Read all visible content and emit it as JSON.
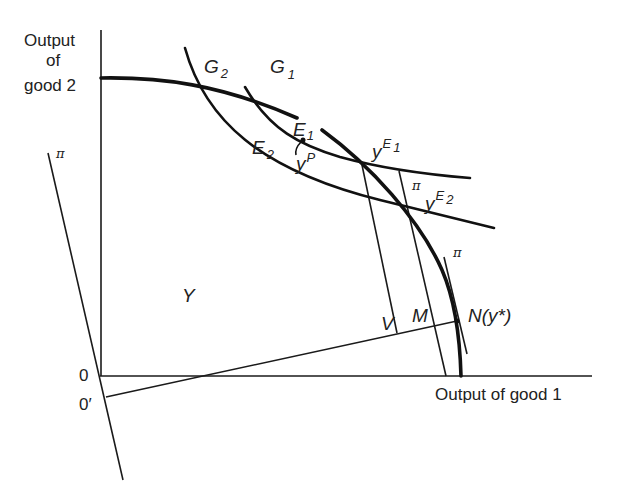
{
  "axes": {
    "y_label_line1": "Output",
    "y_label_line2": "of",
    "y_label_line3": "good 2",
    "x_label": "Output of good 1",
    "origin": "0",
    "origin_prime": "0′"
  },
  "labels": {
    "G2_main": "G",
    "G2_sub": "2",
    "G1_main": "G",
    "G1_sub": "1",
    "E1_main": "E",
    "E1_sub": "1",
    "E2_main": "E",
    "E2_sub": "2",
    "yP_main": "y",
    "yP_sup": "P",
    "yE1_main": "y",
    "yE1_sup_main": "E",
    "yE1_sup_sub": "1",
    "yE2_main": "y",
    "yE2_sup_main": "E",
    "yE2_sup_sub": "2",
    "Y": "Y",
    "V": "V",
    "M": "M",
    "N": "N(y*)",
    "pi_left": "π",
    "pi_mid": "π",
    "pi_right": "π"
  }
}
